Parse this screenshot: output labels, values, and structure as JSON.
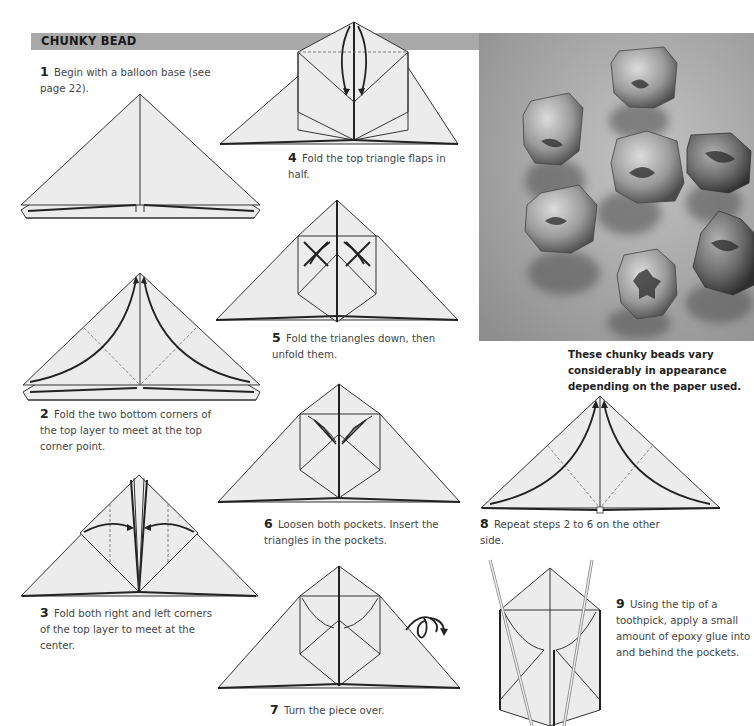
{
  "header": {
    "title": "CHUNKY BEAD",
    "bar_color": "#a9a9a9"
  },
  "steps": [
    {
      "num": "1",
      "text": "Begin with a balloon base (see page 22)."
    },
    {
      "num": "2",
      "text": "Fold the two bottom corners of the top layer to meet at the top corner point."
    },
    {
      "num": "3",
      "text": "Fold both right and left corners of the top layer to meet at the center."
    },
    {
      "num": "4",
      "text": "Fold the top triangle flaps in half."
    },
    {
      "num": "5",
      "text": "Fold the triangles down, then unfold them."
    },
    {
      "num": "6",
      "text": "Loosen both pockets. Insert the triangles in the pockets."
    },
    {
      "num": "7",
      "text": "Turn the piece over."
    },
    {
      "num": "8",
      "text": "Repeat steps 2 to 6 on the other side."
    },
    {
      "num": "9",
      "text": "Using the tip of a toothpick, apply a small amount of epoxy glue into and behind the pockets."
    }
  ],
  "photo": {
    "caption": "These chunky beads vary considerably in appearance depending on the paper used.",
    "subject": "seven paper chunky beads on textured background"
  },
  "icons": {
    "turn_over": "turn-over-arrow-icon"
  }
}
